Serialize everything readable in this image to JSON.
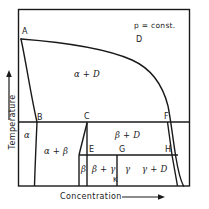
{
  "figure": {
    "type": "phase-diagram",
    "condition_label": "p = const.",
    "axes": {
      "x": {
        "title": "Concentration",
        "arrow": "right-arrow-icon"
      },
      "y": {
        "title": "Temperature",
        "arrow": "up-arrow-icon"
      }
    },
    "point_labels": [
      {
        "id": "A",
        "text": "A",
        "x": 22,
        "y": 28
      },
      {
        "id": "D_top",
        "text": "D",
        "x": 136,
        "y": 36
      },
      {
        "id": "B",
        "text": "B",
        "x": 37,
        "y": 114
      },
      {
        "id": "C",
        "text": "C",
        "x": 84,
        "y": 114
      },
      {
        "id": "F",
        "text": "F",
        "x": 165,
        "y": 114
      },
      {
        "id": "E",
        "text": "E",
        "x": 89,
        "y": 146
      },
      {
        "id": "G",
        "text": "G",
        "x": 119,
        "y": 146
      },
      {
        "id": "H",
        "text": "H",
        "x": 165,
        "y": 146
      },
      {
        "id": "K",
        "text": "K",
        "x": 118,
        "y": 178
      }
    ],
    "region_labels": [
      {
        "id": "alpha-plus-D",
        "text": "α + D",
        "x": 79,
        "y": 70
      },
      {
        "id": "alpha",
        "text": "α",
        "x": 26,
        "y": 134
      },
      {
        "id": "alpha-plus-beta",
        "text": "α + β",
        "x": 48,
        "y": 148
      },
      {
        "id": "beta-plus-D",
        "text": "β + D",
        "x": 118,
        "y": 134
      },
      {
        "id": "beta",
        "text": "β",
        "x": 82,
        "y": 166
      },
      {
        "id": "beta-plus-gamma",
        "text": "β + γ",
        "x": 96,
        "y": 166
      },
      {
        "id": "gamma",
        "text": "γ",
        "x": 127,
        "y": 166
      },
      {
        "id": "gamma-plus-D",
        "text": "γ + D",
        "x": 146,
        "y": 166
      }
    ],
    "colors": {
      "line": "#1a1a1a",
      "background": "#ffffff",
      "text": "#1a1a1a"
    },
    "geometry": {
      "frame": {
        "left": 18,
        "top": 9,
        "right": 190,
        "bottom": 186
      },
      "liquidus_left": "A(21,39) down to B(37,122)",
      "liquidus_top": "A(21,39) across to near F, steep drop to (184,186)",
      "eutectic_line_upper": "y=122 from x=18 to x=190",
      "eutectic_line_lower": "y=155 from x=79 to x=179",
      "vertical_C": "x=87 from y=122 to y=186",
      "vertical_beta_E": "slanted from C(87,122) to E(79,155)",
      "vertical_G_K": "x=117 from y=155 to y=186",
      "vertical_B": "x=37 from y=122 to y=186",
      "right_edge_drop": "F(168,122) to (180,186)"
    }
  }
}
